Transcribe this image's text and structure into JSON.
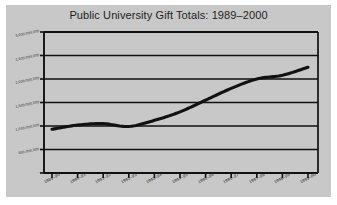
{
  "figure": {
    "title": "Public University Gift Totals: 1989–2000",
    "panel_color": "#c8c8c8",
    "page_color": "#ffffff",
    "line_color": "#111111",
    "axis_color": "#101010",
    "grid_color": "#101010"
  },
  "chart_data": {
    "type": "line",
    "title": "Public University Gift Totals: 1989–2000",
    "xlabel": "",
    "ylabel": "",
    "grid": true,
    "legend": null,
    "ylim": [
      0,
      3000000000
    ],
    "categories": [
      "1989–90",
      "1990–91",
      "1991–92",
      "1992–93",
      "1993–94",
      "1994–95",
      "1995–96",
      "1996–97",
      "1997–98",
      "1998–99",
      "1999–00"
    ],
    "values": [
      930000000,
      1020000000,
      1050000000,
      990000000,
      1120000000,
      1300000000,
      1550000000,
      1800000000,
      2000000000,
      2080000000,
      2250000000
    ],
    "ytick_values": [
      0,
      500000000,
      1000000000,
      1500000000,
      2000000000,
      2500000000,
      3000000000
    ],
    "ytick_labels": [
      "-",
      "500,000,000",
      "1,000,000,000",
      "1,500,000,000",
      "2,000,000,000",
      "2,500,000,000",
      "3,000,000,000"
    ],
    "xtick_labels": [
      "1989–90",
      "1990–91",
      "1991–92",
      "1992–93",
      "1993–94",
      "1994–95",
      "1995–96",
      "1996–97",
      "1997–98",
      "1998–99",
      "1999–00"
    ]
  }
}
